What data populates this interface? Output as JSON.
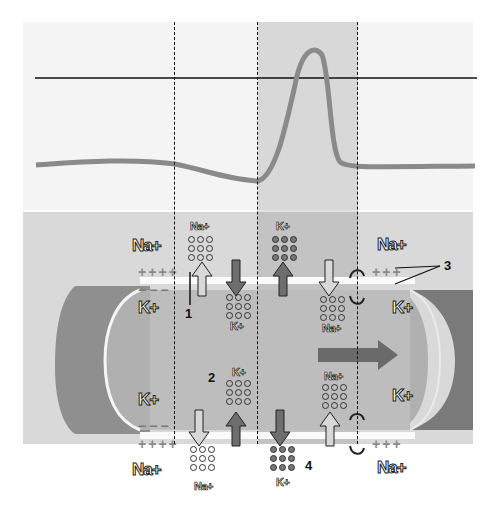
{
  "diagram": {
    "type": "action-potential-propagation",
    "colors": {
      "top_panel_bg": "#f4f4f4",
      "bottom_panel_bg": "#d9d9d9",
      "band_shade": "#b8b8b8",
      "trace": "#8a8a8a",
      "axon_inner": "#a8a8a8",
      "arrow_dark": "#6e6e6e",
      "arrow_light": "#d0d0d0"
    },
    "graph": {
      "zero_line_y": 78,
      "trace_description": "membrane potential: flat resting, slight dip, sharp spike above zero line, return to resting"
    },
    "ions": {
      "outside_top_left": "Na+",
      "inside_top_left": "K+",
      "inside_bottom_left": "K+",
      "outside_bottom_left": "Na+",
      "outside_top_right": "Na+",
      "inside_top_right": "K+",
      "inside_bottom_right": "K+",
      "outside_bottom_right": "Na+"
    },
    "channel_labels": {
      "c1_top_out": "Na+",
      "c2_top_in": "K+",
      "c3_top_out": "K+",
      "c4_top_in": "Na+",
      "c1_bot_out": "Na+",
      "c2_bot_in": "K+",
      "c3_bot_out": "K+",
      "c4_bot_in": "Na+"
    },
    "numbers": {
      "n1": "1",
      "n2": "2",
      "n3": "3",
      "n4": "4"
    },
    "charges": {
      "plus": "+",
      "minus": "−"
    }
  }
}
